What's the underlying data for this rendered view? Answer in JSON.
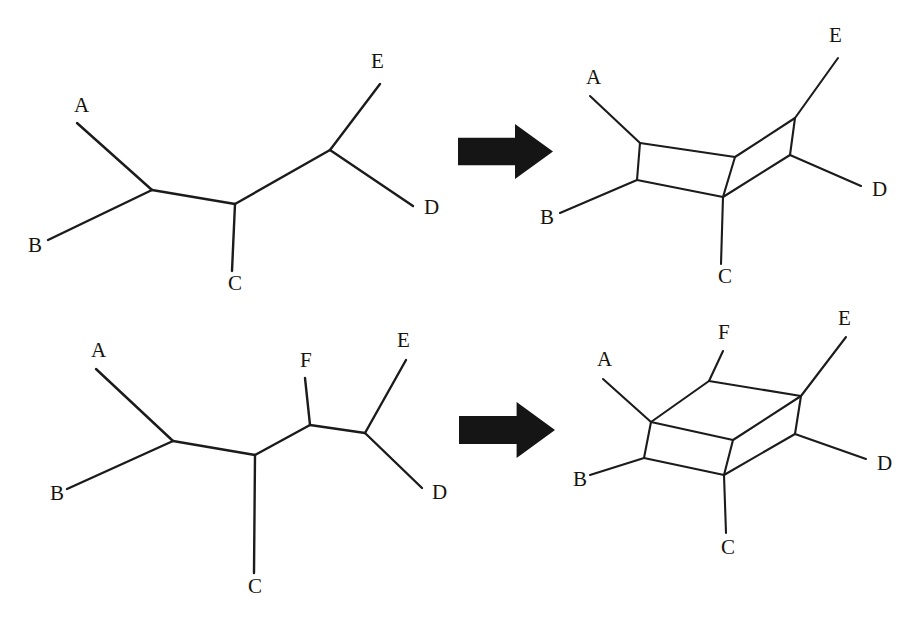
{
  "figure": {
    "background_color": "#ffffff",
    "line_color": "#1b1b1b",
    "arrow_color": "#151515",
    "width": 922,
    "height": 625
  },
  "panels": [
    {
      "id": "top-left-tree",
      "kind": "tree",
      "row": "top",
      "side": "left",
      "taxa": [
        "A",
        "B",
        "C",
        "D",
        "E"
      ],
      "labels": [
        {
          "text": "A",
          "x": 74,
          "y": 112
        },
        {
          "text": "B",
          "x": 28,
          "y": 252
        },
        {
          "text": "C",
          "x": 228,
          "y": 290
        },
        {
          "text": "D",
          "x": 424,
          "y": 214
        },
        {
          "text": "E",
          "x": 371,
          "y": 68
        }
      ],
      "nodes": {
        "n1": {
          "x": 152,
          "y": 190
        },
        "n2": {
          "x": 235,
          "y": 204
        },
        "n3": {
          "x": 330,
          "y": 150
        }
      },
      "tips": {
        "A": {
          "x": 77,
          "y": 123
        },
        "B": {
          "x": 48,
          "y": 240
        },
        "C": {
          "x": 232,
          "y": 271
        },
        "D": {
          "x": 413,
          "y": 206
        },
        "E": {
          "x": 380,
          "y": 84
        }
      },
      "edges": [
        [
          "A",
          "n1"
        ],
        [
          "B",
          "n1"
        ],
        [
          "n1",
          "n2"
        ],
        [
          "C",
          "n2"
        ],
        [
          "n2",
          "n3"
        ],
        [
          "n3",
          "E"
        ],
        [
          "n3",
          "D"
        ]
      ]
    },
    {
      "id": "top-right-network",
      "kind": "split-network",
      "row": "top",
      "side": "right",
      "taxa": [
        "A",
        "B",
        "C",
        "D",
        "E"
      ],
      "labels": [
        {
          "text": "A",
          "x": 586,
          "y": 84
        },
        {
          "text": "B",
          "x": 540,
          "y": 224
        },
        {
          "text": "C",
          "x": 718,
          "y": 283
        },
        {
          "text": "D",
          "x": 872,
          "y": 196
        },
        {
          "text": "E",
          "x": 829,
          "y": 42
        }
      ],
      "tips": {
        "A": {
          "x": 590,
          "y": 96
        },
        "B": {
          "x": 560,
          "y": 213
        },
        "C": {
          "x": 721,
          "y": 264
        },
        "D": {
          "x": 861,
          "y": 186
        },
        "E": {
          "x": 838,
          "y": 58
        }
      },
      "nodes": {
        "q_tl": {
          "x": 640,
          "y": 143
        },
        "q_bl": {
          "x": 637,
          "y": 180
        },
        "q_tr": {
          "x": 735,
          "y": 157
        },
        "q_br": {
          "x": 723,
          "y": 197
        },
        "r_top": {
          "x": 795,
          "y": 118
        },
        "r_right": {
          "x": 790,
          "y": 155
        }
      },
      "edges": [
        [
          "A",
          "q_tl"
        ],
        [
          "B",
          "q_bl"
        ],
        [
          "q_tl",
          "q_tr"
        ],
        [
          "q_tl",
          "q_bl"
        ],
        [
          "q_bl",
          "q_br"
        ],
        [
          "q_tr",
          "q_br"
        ],
        [
          "q_tr",
          "r_top"
        ],
        [
          "q_br",
          "r_right"
        ],
        [
          "r_top",
          "r_right"
        ],
        [
          "r_top",
          "E"
        ],
        [
          "r_right",
          "D"
        ],
        [
          "q_br",
          "C"
        ]
      ]
    },
    {
      "id": "bottom-left-tree",
      "kind": "tree",
      "row": "bottom",
      "side": "left",
      "taxa": [
        "A",
        "B",
        "C",
        "D",
        "E",
        "F"
      ],
      "labels": [
        {
          "text": "A",
          "x": 91,
          "y": 357
        },
        {
          "text": "B",
          "x": 50,
          "y": 500
        },
        {
          "text": "C",
          "x": 248,
          "y": 593
        },
        {
          "text": "D",
          "x": 432,
          "y": 499
        },
        {
          "text": "E",
          "x": 397,
          "y": 347
        },
        {
          "text": "F",
          "x": 300,
          "y": 367
        }
      ],
      "tips": {
        "A": {
          "x": 96,
          "y": 369
        },
        "B": {
          "x": 67,
          "y": 489
        },
        "C": {
          "x": 254,
          "y": 573
        },
        "D": {
          "x": 422,
          "y": 488
        },
        "E": {
          "x": 406,
          "y": 360
        },
        "F": {
          "x": 305,
          "y": 378
        }
      },
      "nodes": {
        "n1": {
          "x": 173,
          "y": 441
        },
        "n2": {
          "x": 255,
          "y": 455
        },
        "n3": {
          "x": 310,
          "y": 425
        },
        "n4": {
          "x": 365,
          "y": 433
        }
      },
      "edges": [
        [
          "A",
          "n1"
        ],
        [
          "B",
          "n1"
        ],
        [
          "n1",
          "n2"
        ],
        [
          "C",
          "n2"
        ],
        [
          "n2",
          "n3"
        ],
        [
          "n3",
          "F"
        ],
        [
          "n3",
          "n4"
        ],
        [
          "n4",
          "E"
        ],
        [
          "n4",
          "D"
        ]
      ]
    },
    {
      "id": "bottom-right-network",
      "kind": "split-network",
      "row": "bottom",
      "side": "right",
      "taxa": [
        "A",
        "B",
        "C",
        "D",
        "E",
        "F"
      ],
      "labels": [
        {
          "text": "A",
          "x": 597,
          "y": 366
        },
        {
          "text": "B",
          "x": 573,
          "y": 486
        },
        {
          "text": "C",
          "x": 721,
          "y": 554
        },
        {
          "text": "D",
          "x": 877,
          "y": 470
        },
        {
          "text": "E",
          "x": 838,
          "y": 325
        },
        {
          "text": "F",
          "x": 718,
          "y": 339
        }
      ],
      "tips": {
        "A": {
          "x": 603,
          "y": 379
        },
        "B": {
          "x": 590,
          "y": 475
        },
        "C": {
          "x": 726,
          "y": 533
        },
        "D": {
          "x": 866,
          "y": 459
        },
        "E": {
          "x": 846,
          "y": 337
        },
        "F": {
          "x": 723,
          "y": 351
        }
      },
      "nodes": {
        "fl_t": {
          "x": 651,
          "y": 422
        },
        "fl_b": {
          "x": 644,
          "y": 458
        },
        "fr_t": {
          "x": 733,
          "y": 440
        },
        "fr_b": {
          "x": 724,
          "y": 475
        },
        "bl_t": {
          "x": 709,
          "y": 381
        },
        "br_t": {
          "x": 801,
          "y": 396
        },
        "r_mid": {
          "x": 795,
          "y": 434
        }
      },
      "edges": [
        [
          "A",
          "fl_t"
        ],
        [
          "B",
          "fl_b"
        ],
        [
          "fl_t",
          "fl_b"
        ],
        [
          "fl_t",
          "fr_t"
        ],
        [
          "fl_b",
          "fr_b"
        ],
        [
          "fr_t",
          "fr_b"
        ],
        [
          "fl_t",
          "bl_t"
        ],
        [
          "bl_t",
          "br_t"
        ],
        [
          "fr_t",
          "br_t"
        ],
        [
          "br_t",
          "r_mid"
        ],
        [
          "fr_b",
          "r_mid"
        ],
        [
          "br_t",
          "E"
        ],
        [
          "r_mid",
          "D"
        ],
        [
          "fr_b",
          "C"
        ],
        [
          "bl_t",
          "F"
        ]
      ]
    }
  ],
  "arrows": [
    {
      "id": "arrow-top",
      "direction": "right",
      "x": 458,
      "y": 124,
      "width": 95,
      "height": 55
    },
    {
      "id": "arrow-bottom",
      "direction": "right",
      "x": 459,
      "y": 402,
      "width": 96,
      "height": 56
    }
  ],
  "icons": {
    "arrow_right": "arrow-right-icon"
  }
}
